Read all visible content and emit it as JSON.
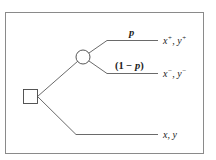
{
  "diagram": {
    "type": "decision-tree",
    "decision_node": {
      "shape": "square"
    },
    "chance_node": {
      "shape": "circle"
    },
    "branches": {
      "upper_prob_label": {
        "open": "",
        "var": "p",
        "close": ""
      },
      "lower_prob_label": {
        "open": "(1 − ",
        "var": "p",
        "close": ")"
      }
    },
    "outcomes": {
      "gain": {
        "x": "x",
        "xsup": "+",
        "sep": ", ",
        "y": "y",
        "ysup": "+"
      },
      "loss": {
        "x": "x",
        "xsup": "−",
        "sep": ", ",
        "y": "y",
        "ysup": "−"
      },
      "certain": {
        "text": "x, y"
      }
    },
    "colors": {
      "line": "#444444",
      "frame": "#888888"
    }
  }
}
